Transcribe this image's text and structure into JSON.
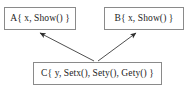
{
  "diagram": {
    "type": "class-inheritance-diagram",
    "background_color": "#ffffff",
    "border_color": "#8a8a8a",
    "text_color": "#1c1c1c",
    "arrow_color": "#3a3a3a",
    "boxes": [
      {
        "id": "A",
        "label": "A{ x, Show() }",
        "class_name": "A",
        "members": [
          "x",
          "Show()"
        ],
        "position": "top-left"
      },
      {
        "id": "B",
        "label": "B{ x, Show() }",
        "class_name": "B",
        "members": [
          "x",
          "Show()"
        ],
        "position": "top-right"
      },
      {
        "id": "C",
        "label": "C{ y, Setx(), Sety(), Gety() }",
        "class_name": "C",
        "members": [
          "y",
          "Setx()",
          "Sety()",
          "Gety()"
        ],
        "position": "bottom-center"
      }
    ],
    "arrows": [
      {
        "id": "c-to-a",
        "from": "C",
        "to": "A",
        "style": "solid-filled-arrowhead"
      },
      {
        "id": "c-to-b",
        "from": "C",
        "to": "B",
        "style": "solid-filled-arrowhead"
      }
    ]
  }
}
